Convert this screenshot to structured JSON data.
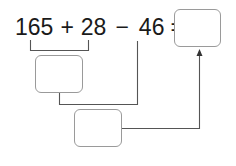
{
  "equation": {
    "operand1": "165",
    "operator1": "+",
    "operand2": "28",
    "operator2": "−",
    "operand3": "46",
    "equals": "="
  },
  "boxes": {
    "step1_sum": {
      "value": ""
    },
    "step2_difference": {
      "value": ""
    },
    "final_answer": {
      "value": ""
    }
  },
  "colors": {
    "text": "#1a1a1a",
    "box_border": "#9a9a9a",
    "connector": "#555555"
  }
}
